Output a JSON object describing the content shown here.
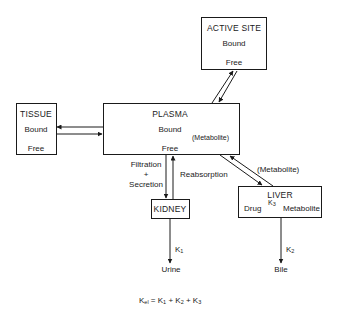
{
  "diagram": {
    "nodes": {
      "active_site": {
        "title": "ACTIVE SITE",
        "top": "Bound",
        "bottom": "Free"
      },
      "tissue": {
        "title": "TISSUE",
        "top": "Bound",
        "bottom": "Free"
      },
      "plasma": {
        "title": "PLASMA",
        "top": "Bound",
        "bottom": "Free",
        "side_note": "(Metabolite)"
      },
      "kidney": {
        "title": "KIDNEY"
      },
      "liver": {
        "title": "LIVER",
        "left": "Drug",
        "rate": "K",
        "rate_sub": "3",
        "right": "Metabolite"
      }
    },
    "edge_labels": {
      "filtration_line1": "Filtration",
      "filtration_plus": "+",
      "filtration_line2": "Secretion",
      "reabsorption": "Reabsorption",
      "metabolite_to_liver": "(Metabolite)",
      "k1": "K",
      "k1_sub": "1",
      "k2": "K",
      "k2_sub": "2"
    },
    "outputs": {
      "urine": "Urine",
      "bile": "Bile"
    },
    "equation": {
      "lhs": "K",
      "lhs_sub": "el",
      "eq": " = ",
      "t1": "K",
      "t1_sub": "1",
      "plus1": " + ",
      "t2": "K",
      "t2_sub": "2",
      "plus2": " + ",
      "t3": "K",
      "t3_sub": "3"
    }
  }
}
